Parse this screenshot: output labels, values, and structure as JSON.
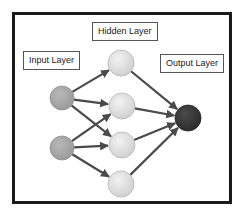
{
  "diagram": {
    "type": "neural-network",
    "labels": {
      "input": "Input Layer",
      "hidden": "Hidden Layer",
      "output": "Output Layer"
    },
    "colors": {
      "frame": "#1a1a1a",
      "input_node": "#a6a6a6",
      "hidden_node": "#dedede",
      "output_node": "#3a3a3a",
      "edge": "#4a4a4a"
    },
    "layers": [
      {
        "name": "input",
        "nodes": [
          "i1",
          "i2"
        ]
      },
      {
        "name": "hidden",
        "nodes": [
          "h1",
          "h2",
          "h3",
          "h4"
        ]
      },
      {
        "name": "output",
        "nodes": [
          "o1"
        ]
      }
    ],
    "edges": [
      [
        "i1",
        "h1"
      ],
      [
        "i1",
        "h2"
      ],
      [
        "i1",
        "h3"
      ],
      [
        "i2",
        "h2"
      ],
      [
        "i2",
        "h3"
      ],
      [
        "i2",
        "h4"
      ],
      [
        "h1",
        "o1"
      ],
      [
        "h2",
        "o1"
      ],
      [
        "h3",
        "o1"
      ],
      [
        "h4",
        "o1"
      ]
    ]
  }
}
